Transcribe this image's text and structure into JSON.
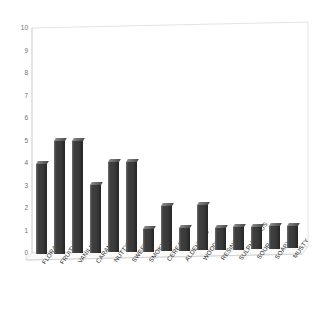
{
  "chart_data": {
    "type": "bar",
    "title": "",
    "subtitle": "",
    "xlabel": "",
    "ylabel": "",
    "ylim": [
      0,
      10
    ],
    "ytick_labels": [
      "10",
      "9",
      "8",
      "7",
      "6",
      "5",
      "4",
      "3",
      "2",
      "1",
      "0"
    ],
    "ytick_values": [
      10,
      9,
      8,
      7,
      6,
      5,
      4,
      3,
      2,
      1,
      0
    ],
    "grid": false,
    "legend": false,
    "legend_position": "none",
    "style": "3d-bar",
    "bar_color": "#3d3d3d",
    "frame_color": "#d8d8d8",
    "background_color": "#ffffff",
    "categories": [
      "FLORAL",
      "FRUITY",
      "VANILLA",
      "CARAMEL",
      "NUTTY",
      "SWEET",
      "SMOKY",
      "CEREAL",
      "ALDEHYDIC",
      "WOODY",
      "RESINOUS",
      "SULPHUROUS",
      "SOUR",
      "SOAPY",
      "MUSTY"
    ],
    "values": [
      4,
      5,
      5,
      3,
      4,
      4,
      1,
      2,
      1,
      2,
      1,
      1,
      1,
      1,
      1
    ],
    "series": [
      {
        "name": "",
        "values": [
          4,
          5,
          5,
          3,
          4,
          4,
          1,
          2,
          1,
          2,
          1,
          1,
          1,
          1,
          1
        ]
      }
    ]
  }
}
